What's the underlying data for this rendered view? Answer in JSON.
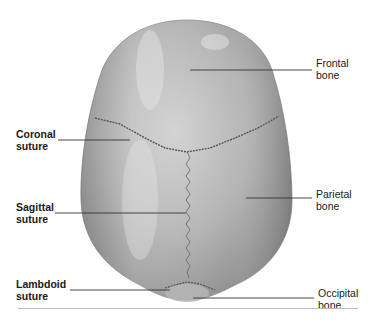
{
  "figure": {
    "labels": {
      "frontal_bone": {
        "line1": "Frontal",
        "line2": "bone"
      },
      "coronal_suture": {
        "line1": "Coronal",
        "line2": "suture"
      },
      "parietal_bone": {
        "line1": "Parietal",
        "line2": "bone"
      },
      "sagittal_suture": {
        "line1": "Sagittal",
        "line2": "suture"
      },
      "lambdoid_suture": {
        "line1": "Lambdoid",
        "line2": "suture"
      },
      "occipital_bone": {
        "line1": "Occipital",
        "line2": "bone"
      }
    },
    "colors": {
      "bone_fill": "#a9a9a9",
      "bone_highlight": "#d2d2d2",
      "suture": "#555555",
      "leader_line": "#333333",
      "bottom_rule": "#bdbdbd"
    }
  }
}
